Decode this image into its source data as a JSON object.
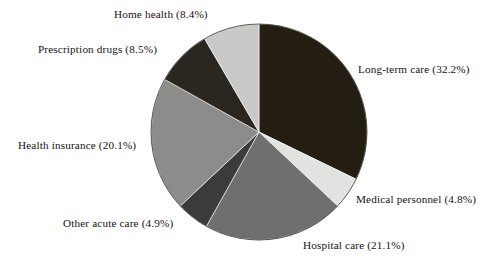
{
  "chart_data": {
    "type": "pie",
    "title": "",
    "xlabel": "",
    "ylabel": "",
    "legend_position": "outside-labels",
    "grid": false,
    "start_angle_deg": 0,
    "direction": "clockwise",
    "units": "percent",
    "categories": [
      "Long-term care",
      "Medical personnel",
      "Hospital care",
      "Other acute care",
      "Health insurance",
      "Prescription drugs",
      "Home health"
    ],
    "values": [
      32.2,
      4.8,
      21.1,
      4.9,
      20.1,
      8.5,
      8.4
    ],
    "slices": [
      {
        "name": "Long-term care",
        "value": 32.2,
        "label": "Long-term care (32.2%)",
        "color": "#231d12",
        "start_deg": 0.0,
        "end_deg": 115.92
      },
      {
        "name": "Medical personnel",
        "value": 4.8,
        "label": "Medical personnel (4.8%)",
        "color": "#e2e2e0",
        "start_deg": 115.92,
        "end_deg": 133.2
      },
      {
        "name": "Hospital care",
        "value": 21.1,
        "label": "Hospital care (21.1%)",
        "color": "#6f6f6f",
        "start_deg": 133.2,
        "end_deg": 209.16
      },
      {
        "name": "Other acute care",
        "value": 4.9,
        "label": "Other acute care (4.9%)",
        "color": "#3b3b3a",
        "start_deg": 209.16,
        "end_deg": 226.8
      },
      {
        "name": "Health insurance",
        "value": 20.1,
        "label": "Health insurance (20.1%)",
        "color": "#8c8c8b",
        "start_deg": 226.8,
        "end_deg": 299.16
      },
      {
        "name": "Prescription drugs",
        "value": 8.5,
        "label": "Prescription drugs (8.5%)",
        "color": "#2b2620",
        "start_deg": 299.16,
        "end_deg": 329.76
      },
      {
        "name": "Home health",
        "value": 8.4,
        "label": "Home health (8.4%)",
        "color": "#c9c9c7",
        "start_deg": 329.76,
        "end_deg": 360.0
      }
    ],
    "geometry": {
      "center_x": 259,
      "center_y": 132,
      "radius": 108
    }
  },
  "labels": {
    "home_health": "Home health (8.4%)",
    "prescription_drugs": "Prescription drugs (8.5%)",
    "health_insurance": "Health insurance (20.1%)",
    "other_acute_care": "Other acute care (4.9%)",
    "hospital_care": "Hospital care (21.1%)",
    "medical_personnel": "Medical personnel (4.8%)",
    "long_term_care": "Long-term care (32.2%)"
  },
  "colors": {
    "background": "#ffffff",
    "text": "#15120f",
    "outline": "#1a1a1a"
  }
}
